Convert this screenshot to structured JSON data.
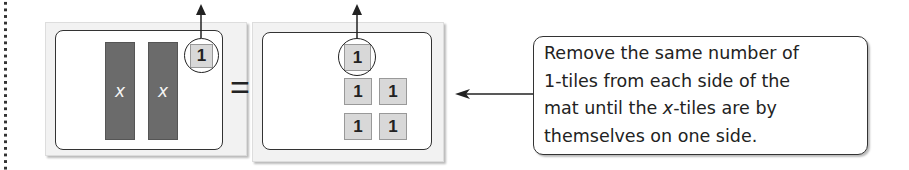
{
  "left_mat": {
    "x_tiles": [
      {
        "label": "x"
      },
      {
        "label": "x"
      }
    ],
    "one_tiles": [
      {
        "label": "1",
        "circled": true
      }
    ]
  },
  "equals_sign": "=",
  "right_mat": {
    "one_tiles": [
      {
        "label": "1",
        "circled": true
      },
      {
        "label": "1"
      },
      {
        "label": "1"
      },
      {
        "label": "1"
      },
      {
        "label": "1"
      }
    ]
  },
  "callout": {
    "line1": "Remove the same number of",
    "line2": "1-tiles from each side of the",
    "line3_pre": "mat until the ",
    "line3_var": "x",
    "line3_post": "-tiles are by",
    "line4": "themselves on one side."
  },
  "colors": {
    "x_tile": "#6b6b6b",
    "one_tile": "#d8d8d8",
    "outline": "#333333"
  }
}
